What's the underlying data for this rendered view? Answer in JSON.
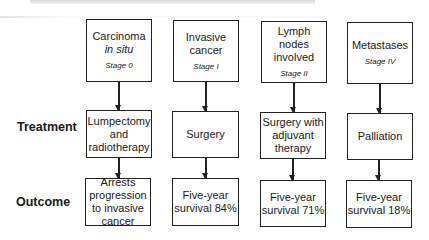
{
  "stages": [
    {
      "title": "Carcinoma",
      "subtitle": "in situ",
      "stage": "Stage 0"
    },
    {
      "title": "Invasive\ncancer",
      "subtitle": "",
      "stage": "Stage I"
    },
    {
      "title": "Lymph\nnodes\ninvolved",
      "subtitle": "",
      "stage": "Stage II"
    },
    {
      "title": "Metastases",
      "subtitle": "",
      "stage": "Stage IV"
    }
  ],
  "row_labels": {
    "treatment": "Treatment",
    "outcome": "Outcome"
  },
  "treatments": [
    "Lumpectomy\nand\nradiotherapy",
    "Surgery",
    "Surgery with\nadjuvant\ntherapy",
    "Palliation"
  ],
  "outcomes": [
    "Arrests\nprogression\nto invasive\ncancer",
    "Five-year\nsurvival 84%",
    "Five-year\nsurvival 71%",
    "Five-year\nsurvival 18%"
  ]
}
